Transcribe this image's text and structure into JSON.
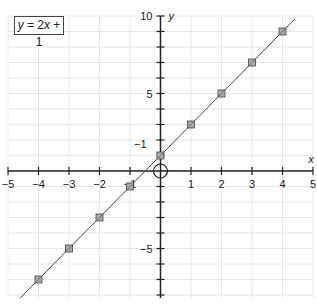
{
  "chart_data": {
    "type": "line",
    "title": "",
    "equation_label": "y = 2x + 1",
    "xlabel": "x",
    "ylabel": "y",
    "xlim": [
      -5,
      5
    ],
    "ylim": [
      -8.2,
      10
    ],
    "x_ticks": [
      -5,
      -4,
      -3,
      -2,
      -1,
      0,
      1,
      2,
      3,
      4,
      5
    ],
    "x_tick_labels": [
      "-5",
      "-4",
      "-3",
      "-2",
      "-1",
      "1",
      "2",
      "3",
      "4",
      "5"
    ],
    "y_tick_labels": [
      {
        "value": 10,
        "label": "10"
      },
      {
        "value": 5,
        "label": "5"
      },
      {
        "value": 1,
        "label": "1"
      },
      {
        "value": -5,
        "label": "-5"
      }
    ],
    "grid": true,
    "series": [
      {
        "name": "y = 2x + 1",
        "x": [
          -4,
          -3,
          -2,
          -1,
          0,
          1,
          2,
          3,
          4
        ],
        "y": [
          -7,
          -5,
          -3,
          -1,
          1,
          3,
          5,
          7,
          9
        ],
        "marker": "square",
        "color": "#555555"
      }
    ],
    "origin_marker": "circle",
    "line_range_x": [
      -4.5,
      4.5
    ]
  },
  "legend": {
    "y": "y",
    "eq": " = 2",
    "x": "x",
    "tail": " + 1"
  }
}
